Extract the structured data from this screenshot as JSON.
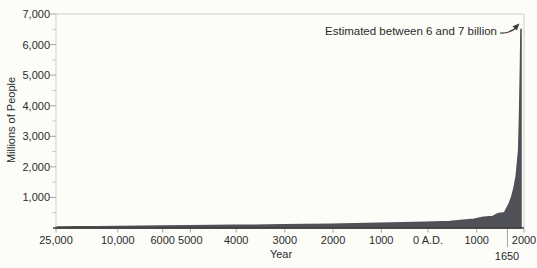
{
  "chart_data": {
    "type": "area",
    "title": "",
    "xlabel": "Year",
    "ylabel": "Millions of People",
    "ylim": [
      0,
      7000
    ],
    "grid": "off",
    "frame": "light top and right border, light left axis, dark bottom axis",
    "annotation": {
      "text": "Estimated between 6 and 7 billion",
      "points_to": {
        "year": 2000,
        "value_millions": 6500
      }
    },
    "y_axis": {
      "label": "Millions of People",
      "minor_tick_interval": 500,
      "ticks": [
        {
          "value": 7000,
          "label": "7,000"
        },
        {
          "value": 6000,
          "label": "6,000"
        },
        {
          "value": 5000,
          "label": "5,000"
        },
        {
          "value": 4000,
          "label": "4,000"
        },
        {
          "value": 3000,
          "label": "3,000"
        },
        {
          "value": 2000,
          "label": "2,000"
        },
        {
          "value": 1000,
          "label": "1,000"
        }
      ]
    },
    "x_axis": {
      "label": "Year",
      "scale": "nonlinear; years before 6000 B.C. compressed",
      "ticks": [
        {
          "year": -25000,
          "label": "25,000",
          "pos": 0.0
        },
        {
          "year": -10000,
          "label": "10,000",
          "pos": 0.132
        },
        {
          "year": -6000,
          "label": "6000",
          "pos": 0.228
        },
        {
          "year": -5000,
          "label": "5000",
          "pos": 0.287
        },
        {
          "year": -4000,
          "label": "4000",
          "pos": 0.385
        },
        {
          "year": -3000,
          "label": "3000",
          "pos": 0.489
        },
        {
          "year": -2000,
          "label": "2000",
          "pos": 0.592
        },
        {
          "year": -1000,
          "label": "1000",
          "pos": 0.695
        },
        {
          "year": 0,
          "label": "0 A.D.",
          "pos": 0.795
        },
        {
          "year": 1000,
          "label": "1000",
          "pos": 0.899
        },
        {
          "year": 2000,
          "label": "2000",
          "pos": 1.0
        }
      ],
      "special_marker": {
        "year": 1650,
        "label": "1650"
      }
    },
    "series": [
      {
        "name": "population_millions",
        "points": [
          [
            -25000,
            30
          ],
          [
            -20000,
            35
          ],
          [
            -15000,
            40
          ],
          [
            -10000,
            45
          ],
          [
            -8000,
            55
          ],
          [
            -6000,
            65
          ],
          [
            -5000,
            75
          ],
          [
            -4000,
            85
          ],
          [
            -3000,
            100
          ],
          [
            -2000,
            120
          ],
          [
            -1000,
            150
          ],
          [
            -500,
            170
          ],
          [
            0,
            190
          ],
          [
            500,
            210
          ],
          [
            1000,
            280
          ],
          [
            1200,
            350
          ],
          [
            1400,
            375
          ],
          [
            1500,
            460
          ],
          [
            1650,
            500
          ],
          [
            1750,
            800
          ],
          [
            1800,
            1000
          ],
          [
            1850,
            1300
          ],
          [
            1900,
            1700
          ],
          [
            1950,
            2550
          ],
          [
            1970,
            3700
          ],
          [
            1990,
            5300
          ],
          [
            2000,
            6500
          ]
        ]
      }
    ],
    "colors": {
      "area_fill": "#505156",
      "axis_dark": "#3c3c3b",
      "axis_light": "#cfcfca",
      "major_tick": "#a6a6a1",
      "minor_tick": "#c6c6c1",
      "text": "#2b2b2b",
      "background": "#fcfcf9",
      "annotation_arrow": "#3c3c3b"
    }
  }
}
